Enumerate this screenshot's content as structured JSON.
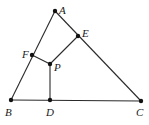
{
  "diagram": {
    "type": "geometry-figure",
    "points": {
      "A": {
        "label": "A",
        "x": 55,
        "y": 11,
        "lx": 59,
        "ly": 14
      },
      "E": {
        "label": "E",
        "x": 78,
        "y": 36,
        "lx": 82,
        "ly": 37
      },
      "F": {
        "label": "F",
        "x": 32,
        "y": 55,
        "lx": 22,
        "ly": 58
      },
      "P": {
        "label": "P",
        "x": 50,
        "y": 64,
        "lx": 54,
        "ly": 71
      },
      "B": {
        "label": "B",
        "x": 11,
        "y": 100,
        "lx": 5,
        "ly": 116
      },
      "D": {
        "label": "D",
        "x": 50,
        "y": 100,
        "lx": 46,
        "ly": 116
      },
      "C": {
        "label": "C",
        "x": 141,
        "y": 101,
        "lx": 136,
        "ly": 116
      }
    },
    "segments": [
      [
        "A",
        "B"
      ],
      [
        "A",
        "C"
      ],
      [
        "B",
        "C"
      ],
      [
        "F",
        "P"
      ],
      [
        "P",
        "E"
      ],
      [
        "P",
        "D"
      ]
    ],
    "stroke_color": "#2a2a2a",
    "point_color": "#111111"
  }
}
